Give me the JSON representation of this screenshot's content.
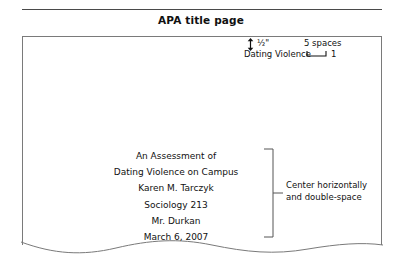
{
  "header": {
    "title": "APA title page"
  },
  "annotations": {
    "margin_arrow_icon": "vertical-double-arrow-icon",
    "margin_label": "½\"",
    "spaces_label": "5  spaces",
    "spaces_bracket_icon": "span-bracket-icon",
    "centering_bracket_icon": "right-brace-icon",
    "centering_note_line1": "Center horizontally",
    "centering_note_line2": "and double-space"
  },
  "page": {
    "running_head": "Dating Violence",
    "page_number": "1",
    "title_block": [
      "An Assessment of",
      "Dating Violence on Campus",
      "Karen M. Tarczyk",
      "Sociology 213",
      "Mr. Durkan",
      "March 6, 2007"
    ]
  },
  "colors": {
    "rule": "#4a4a4a",
    "page_border": "#7a7a7a",
    "text": "#111111"
  }
}
